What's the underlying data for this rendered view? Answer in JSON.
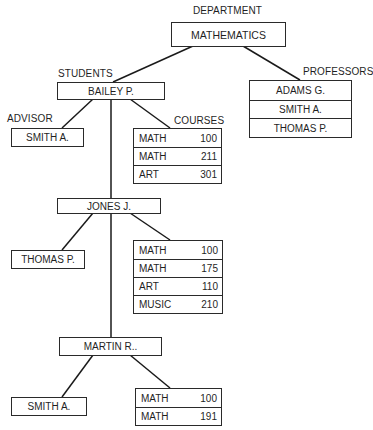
{
  "department": {
    "label": "DEPARTMENT",
    "name": "MATHEMATICS"
  },
  "professors": {
    "label": "PROFESSORS",
    "items": [
      "ADAMS G.",
      "SMITH A.",
      "THOMAS P."
    ]
  },
  "students_label": "STUDENTS",
  "advisor_label": "ADVISOR",
  "courses_label": "COURSES",
  "students": [
    {
      "name": "BAILEY P.",
      "advisor": "SMITH A.",
      "courses": [
        {
          "subject": "MATH",
          "number": "100"
        },
        {
          "subject": "MATH",
          "number": "211"
        },
        {
          "subject": "ART",
          "number": "301"
        }
      ]
    },
    {
      "name": "JONES J.",
      "advisor": "THOMAS P.",
      "courses": [
        {
          "subject": "MATH",
          "number": "100"
        },
        {
          "subject": "MATH",
          "number": "175"
        },
        {
          "subject": "ART",
          "number": "110"
        },
        {
          "subject": "MUSIC",
          "number": "210"
        }
      ]
    },
    {
      "name": "MARTIN R..",
      "advisor": "SMITH A.",
      "courses": [
        {
          "subject": "MATH",
          "number": "100"
        },
        {
          "subject": "MATH",
          "number": "191"
        }
      ]
    }
  ],
  "colors": {
    "line": "#1a1a1a",
    "background": "#ffffff"
  }
}
